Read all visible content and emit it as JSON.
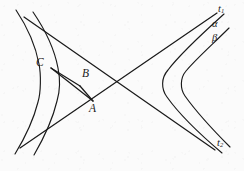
{
  "figure": {
    "kind": "geometry-diagram",
    "background_color": "#fbfbfb",
    "stroke_color": "#1a1a1a",
    "width": 244,
    "height": 171
  },
  "labels": {
    "asymptote_upper": {
      "text": "t",
      "sub": "1",
      "x": 220,
      "y": 8
    },
    "asymptote_lower": {
      "text": "t",
      "sub": "2",
      "x": 219,
      "y": 143
    },
    "curve_outer": {
      "text": "α",
      "x": 215,
      "y": 25
    },
    "curve_inner": {
      "text": "β",
      "x": 215,
      "y": 39
    },
    "point_a": {
      "text": "A",
      "x": 89,
      "y": 103
    },
    "point_b": {
      "text": "B",
      "x": 81,
      "y": 71
    },
    "point_c": {
      "text": "C",
      "x": 39,
      "y": 63
    }
  },
  "geometry": {
    "asymptote_t1": {
      "from": [
        20,
        148
      ],
      "to": [
        217,
        13
      ]
    },
    "asymptote_t2": {
      "from": [
        24,
        17
      ],
      "to": [
        215,
        150
      ]
    },
    "center": [
      118,
      83
    ],
    "left_branch_outer_vertex": [
      32,
      84
    ],
    "left_branch_inner_vertex": [
      52,
      84
    ],
    "right_branch_outer_vertex": [
      152,
      83
    ],
    "right_branch_inner_vertex": [
      170,
      83
    ],
    "chord_ca": {
      "from": [
        52,
        69
      ],
      "to": [
        92,
        100
      ]
    },
    "chord_cb": {
      "from": [
        52,
        69
      ],
      "to": [
        80,
        85
      ]
    },
    "chord_ba": {
      "from": [
        80,
        85
      ],
      "to": [
        92,
        100
      ]
    }
  },
  "points": [
    {
      "name": "A",
      "x": 92,
      "y": 100
    },
    {
      "name": "B",
      "x": 80,
      "y": 85
    },
    {
      "name": "C",
      "x": 52,
      "y": 69
    }
  ]
}
